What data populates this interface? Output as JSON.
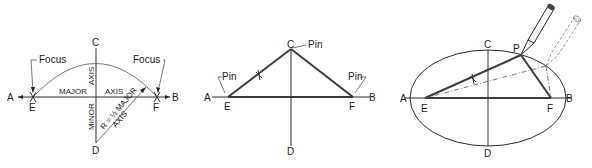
{
  "figure": {
    "panels": [
      {
        "id": "panel-1-construction",
        "points": {
          "A": "A",
          "B": "B",
          "C": "C",
          "D": "D",
          "E": "E",
          "F": "F"
        },
        "labels": {
          "focus_left": "Focus",
          "focus_right": "Focus",
          "major": "MAJOR",
          "axis1": "AXIS",
          "axis_vertical": "AXIS",
          "minor": "MINOR",
          "radius": "R = ½ MAJOR",
          "radius_axis": "AXIS"
        }
      },
      {
        "id": "panel-2-pins",
        "points": {
          "A": "A",
          "B": "B",
          "C": "C",
          "D": "D",
          "E": "E",
          "F": "F"
        },
        "labels": {
          "pin_left": "Pin",
          "pin_top": "Pin",
          "pin_right": "Pin"
        }
      },
      {
        "id": "panel-3-ellipse",
        "points": {
          "A": "A",
          "B": "B",
          "C": "C",
          "D": "D",
          "E": "E",
          "F": "F",
          "P": "P"
        }
      }
    ]
  }
}
